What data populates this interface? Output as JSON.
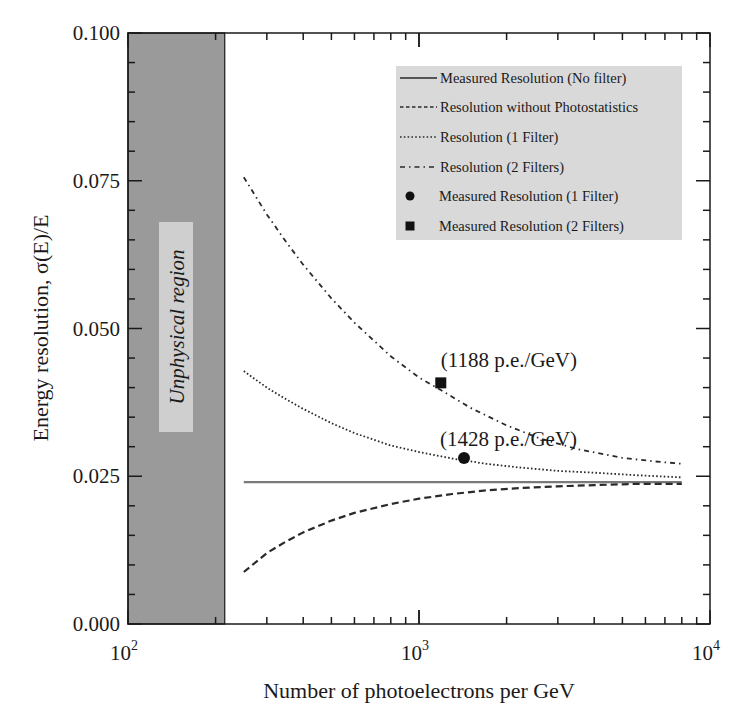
{
  "chart_data": {
    "type": "line",
    "title": "",
    "xlabel": "Number of photoelectrons per GeV",
    "ylabel": "Energy resolution, σ(E)/E",
    "xscale": "log",
    "xlim": [
      100,
      10000
    ],
    "ylim": [
      0.0,
      0.1
    ],
    "grid": false,
    "legend_position": "upper right",
    "x_ticks": [
      {
        "value": 100,
        "base": "10",
        "exp": "2"
      },
      {
        "value": 1000,
        "base": "10",
        "exp": "3"
      },
      {
        "value": 10000,
        "base": "10",
        "exp": "4"
      }
    ],
    "y_ticks": [
      "0.000",
      "0.025",
      "0.050",
      "0.075",
      "0.100"
    ],
    "y_tick_values": [
      0.0,
      0.025,
      0.05,
      0.075,
      0.1
    ],
    "y_minor_step": 0.005,
    "shaded_region": {
      "label": "Unphysical region",
      "x_from": 100,
      "x_to": 215,
      "color": "#9a9a9a"
    },
    "series": [
      {
        "name": "Measured  Resolution (No filter)",
        "style": "solid",
        "color": "#7a7a7a",
        "x": [
          250,
          8000
        ],
        "values": [
          0.024,
          0.024
        ]
      },
      {
        "name": "Resolution without Photostatistics",
        "style": "dashed",
        "color": "#2a2a2a",
        "x": [
          250,
          300,
          350,
          400,
          500,
          600,
          800,
          1000,
          1300,
          1700,
          2200,
          3000,
          4000,
          5500,
          8000
        ],
        "values": [
          0.0088,
          0.012,
          0.014,
          0.0155,
          0.0175,
          0.0188,
          0.0203,
          0.0212,
          0.022,
          0.0226,
          0.023,
          0.0233,
          0.0235,
          0.0237,
          0.0237
        ]
      },
      {
        "name": "Resolution (1 Filter)",
        "style": "dotted",
        "color": "#2a2a2a",
        "x": [
          250,
          300,
          350,
          400,
          500,
          600,
          800,
          1000,
          1300,
          1700,
          2200,
          3000,
          4000,
          5500,
          8000
        ],
        "values": [
          0.0428,
          0.04,
          0.038,
          0.0364,
          0.034,
          0.0323,
          0.0302,
          0.0291,
          0.028,
          0.0271,
          0.0265,
          0.0259,
          0.0256,
          0.0252,
          0.0248
        ]
      },
      {
        "name": "Resolution (2 Filters)",
        "style": "dash-dot",
        "color": "#2a2a2a",
        "x": [
          250,
          300,
          350,
          400,
          500,
          600,
          800,
          1000,
          1188,
          1500,
          2000,
          2600,
          3500,
          5000,
          6500,
          8000
        ],
        "values": [
          0.0756,
          0.0693,
          0.0646,
          0.0608,
          0.0551,
          0.051,
          0.0453,
          0.0417,
          0.0396,
          0.0366,
          0.0336,
          0.0314,
          0.0296,
          0.0281,
          0.0275,
          0.0271
        ]
      }
    ],
    "points": [
      {
        "name": "Measured Resolution (1 Filter)",
        "marker": "circle",
        "x": 1428,
        "y": 0.0281,
        "annotation": "(1428 p.e./GeV)"
      },
      {
        "name": "Measured Resolution (2 Filters)",
        "marker": "square",
        "x": 1188,
        "y": 0.0408,
        "annotation": "(1188 p.e./GeV)"
      }
    ]
  },
  "legend": {
    "items": [
      {
        "label": "Measured  Resolution (No filter)",
        "symbol": "solid"
      },
      {
        "label": "Resolution without Photostatistics",
        "symbol": "dashed"
      },
      {
        "label": "Resolution (1 Filter)",
        "symbol": "dotted"
      },
      {
        "label": "Resolution (2 Filters)",
        "symbol": "dash-dot"
      },
      {
        "label": "Measured Resolution (1 Filter)",
        "symbol": "circle"
      },
      {
        "label": "Measured Resolution (2 Filters)",
        "symbol": "square"
      }
    ],
    "background": "#d9d9d9"
  },
  "colors": {
    "axis": "#1a1a1a",
    "shade": "#9a9a9a",
    "region_label_bg": "#cfcfcf",
    "legend_bg": "#d9d9d9",
    "solid_line": "#7a7a7a"
  }
}
